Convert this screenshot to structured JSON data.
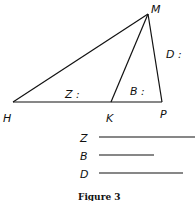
{
  "figure": {
    "caption": "Figure 3",
    "points": {
      "H": "H",
      "M": "M",
      "K": "K",
      "P": "P"
    },
    "segment_labels": {
      "Z": "Z :",
      "B": "B :",
      "D": "D :"
    },
    "legend": [
      {
        "label": "Z"
      },
      {
        "label": "B"
      },
      {
        "label": "D"
      }
    ]
  }
}
